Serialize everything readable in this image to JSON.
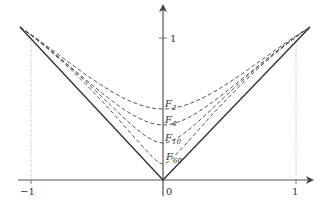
{
  "figure": {
    "type": "function-approximation-plot",
    "axes": {
      "x_ticks": [
        {
          "value": -1,
          "label": "−1"
        },
        {
          "value": 0,
          "label": "0"
        },
        {
          "value": 1,
          "label": "1"
        }
      ],
      "y_ticks": [
        {
          "value": 1,
          "label": "1"
        }
      ]
    },
    "curves": [
      {
        "name": "|x|",
        "style": "solid"
      },
      {
        "name": "F",
        "subscript": "2",
        "style": "dashed",
        "min_y": 0.5
      },
      {
        "name": "F",
        "subscript": "4",
        "style": "dashed",
        "min_y": 0.39
      },
      {
        "name": "F",
        "subscript": "10",
        "style": "dashed",
        "min_y": 0.25
      },
      {
        "name": "F",
        "subscript": "60",
        "style": "dashed",
        "min_y": 0.12
      }
    ],
    "colors": {
      "axis": "#555555",
      "solid_curve": "#333333",
      "dashed_curve": "#555555",
      "guide": "#999999"
    }
  }
}
